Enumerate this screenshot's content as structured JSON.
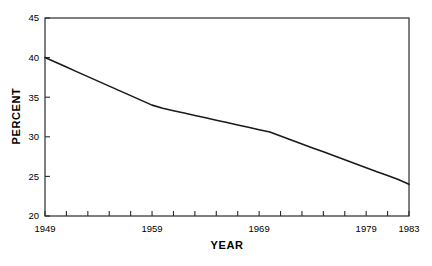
{
  "chart_data": {
    "type": "line",
    "title": "",
    "xlabel": "YEAR",
    "ylabel": "PERCENT",
    "xlim": [
      1949,
      1983
    ],
    "ylim": [
      20,
      45
    ],
    "grid": false,
    "legend": null,
    "yticks": [
      20,
      25,
      30,
      35,
      40,
      45
    ],
    "ytick_labels": [
      "20",
      "25",
      "30",
      "35",
      "40",
      "45"
    ],
    "xticks": [
      1949,
      1959,
      1969,
      1979,
      1983
    ],
    "xtick_labels": [
      "1949",
      "1959",
      "1969",
      "1979",
      "1983"
    ],
    "x_minor_tick_step": 2,
    "line_color": "#1a1a1a",
    "series": [
      {
        "name": "Percent",
        "x": [
          1949,
          1950,
          1951,
          1952,
          1953,
          1954,
          1955,
          1956,
          1957,
          1958,
          1959,
          1960,
          1961,
          1962,
          1963,
          1964,
          1965,
          1966,
          1967,
          1968,
          1969,
          1970,
          1971,
          1972,
          1973,
          1974,
          1975,
          1976,
          1977,
          1978,
          1979,
          1980,
          1981,
          1982,
          1983
        ],
        "values": [
          40.0,
          39.4,
          38.8,
          38.2,
          37.6,
          37.0,
          36.4,
          35.8,
          35.2,
          34.6,
          34.0,
          33.6,
          33.3,
          33.0,
          32.7,
          32.4,
          32.1,
          31.8,
          31.5,
          31.2,
          30.9,
          30.6,
          30.1,
          29.6,
          29.1,
          28.6,
          28.1,
          27.6,
          27.1,
          26.6,
          26.1,
          25.6,
          25.1,
          24.6,
          24.0
        ]
      }
    ]
  },
  "axes": {
    "y_title": "PERCENT",
    "x_title": "YEAR"
  }
}
